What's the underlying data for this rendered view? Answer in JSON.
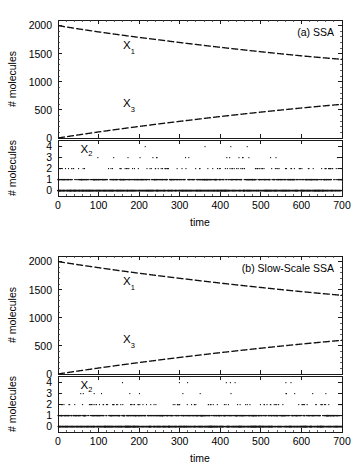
{
  "figure": {
    "panels": [
      {
        "id": "a",
        "tag": "(a) SSA",
        "top_axis": {
          "ylabel": "# molecules",
          "yticks": [
            0,
            500,
            1000,
            1500,
            2000
          ],
          "ylim": [
            0,
            2100
          ],
          "xlim": [
            0,
            700
          ]
        },
        "bottom_axis": {
          "ylabel": "# molecules",
          "yticks": [
            0,
            1,
            2,
            3,
            4
          ],
          "ylim": [
            -0.5,
            4.6
          ],
          "xlim": [
            0,
            700
          ]
        },
        "xlabel": "time",
        "xticks": [
          0,
          100,
          200,
          300,
          400,
          500,
          600,
          700
        ],
        "series_labels": [
          {
            "text": "X",
            "sub": "1",
            "x": 175,
            "y": 1580
          },
          {
            "text": "X",
            "sub": "3",
            "x": 175,
            "y": 560
          },
          {
            "text": "X",
            "sub": "2",
            "x": 70,
            "y": 3.45
          }
        ]
      },
      {
        "id": "b",
        "tag": "(b) Slow-Scale SSA",
        "top_axis": {
          "ylabel": "# molecules",
          "yticks": [
            0,
            500,
            1000,
            1500,
            2000
          ],
          "ylim": [
            0,
            2100
          ],
          "xlim": [
            0,
            700
          ]
        },
        "bottom_axis": {
          "ylabel": "# molecules",
          "yticks": [
            0,
            1,
            2,
            3,
            4
          ],
          "ylim": [
            -0.5,
            4.6
          ],
          "xlim": [
            0,
            700
          ]
        },
        "xlabel": "time",
        "xticks": [
          0,
          100,
          200,
          300,
          400,
          500,
          600,
          700
        ],
        "series_labels": [
          {
            "text": "X",
            "sub": "1",
            "x": 175,
            "y": 1580
          },
          {
            "text": "X",
            "sub": "3",
            "x": 175,
            "y": 560
          },
          {
            "text": "X",
            "sub": "2",
            "x": 70,
            "y": 3.45
          }
        ]
      }
    ]
  },
  "chart_data": [
    {
      "type": "line",
      "panel": "a",
      "title": "(a) SSA",
      "xlabel": "time",
      "ylabel": "# molecules",
      "xlim": [
        0,
        700
      ],
      "ylim": [
        0,
        2100
      ],
      "grid": false,
      "legend": "inline labels",
      "series": [
        {
          "name": "X1",
          "x": [
            0,
            50,
            100,
            150,
            200,
            250,
            300,
            350,
            400,
            450,
            500,
            550,
            600,
            650,
            700
          ],
          "values": [
            2000,
            1942,
            1888,
            1838,
            1790,
            1745,
            1700,
            1656,
            1614,
            1574,
            1535,
            1498,
            1462,
            1430,
            1400
          ]
        },
        {
          "name": "X3",
          "x": [
            0,
            50,
            100,
            150,
            200,
            250,
            300,
            350,
            400,
            450,
            500,
            550,
            600,
            650,
            700
          ],
          "values": [
            0,
            55,
            108,
            158,
            206,
            252,
            296,
            340,
            382,
            422,
            461,
            498,
            534,
            568,
            600
          ]
        }
      ]
    },
    {
      "type": "scatter",
      "panel": "a-inset",
      "title": "",
      "xlabel": "time",
      "ylabel": "# molecules",
      "xlim": [
        0,
        700
      ],
      "ylim": [
        -0.5,
        4.6
      ],
      "grid": false,
      "series": [
        {
          "name": "X2",
          "note": "integer-valued stochastic trace; level 0 near-continuous, level 1 dense, level 2 scattered, levels 3-4 rare",
          "level_density": {
            "0": 0.62,
            "1": 0.28,
            "2": 0.085,
            "3": 0.013,
            "4": 0.002
          }
        }
      ]
    },
    {
      "type": "line",
      "panel": "b",
      "title": "(b) Slow-Scale SSA",
      "xlabel": "time",
      "ylabel": "# molecules",
      "xlim": [
        0,
        700
      ],
      "ylim": [
        0,
        2100
      ],
      "grid": false,
      "legend": "inline labels",
      "series": [
        {
          "name": "X1",
          "x": [
            0,
            50,
            100,
            150,
            200,
            250,
            300,
            350,
            400,
            450,
            500,
            550,
            600,
            650,
            700
          ],
          "values": [
            2000,
            1945,
            1892,
            1841,
            1793,
            1747,
            1703,
            1660,
            1618,
            1578,
            1540,
            1502,
            1466,
            1432,
            1400
          ]
        },
        {
          "name": "X3",
          "x": [
            0,
            50,
            100,
            150,
            200,
            250,
            300,
            350,
            400,
            450,
            500,
            550,
            600,
            650,
            700
          ],
          "values": [
            0,
            54,
            106,
            156,
            204,
            250,
            295,
            338,
            380,
            420,
            459,
            497,
            533,
            567,
            600
          ]
        }
      ]
    },
    {
      "type": "scatter",
      "panel": "b-inset",
      "title": "",
      "xlabel": "time",
      "ylabel": "# molecules",
      "xlim": [
        0,
        700
      ],
      "ylim": [
        -0.5,
        4.6
      ],
      "grid": false,
      "series": [
        {
          "name": "X2",
          "note": "integer-valued stochastic trace; level 0 near-continuous, level 1 dense, level 2 scattered, levels 3-4 rare",
          "level_density": {
            "0": 0.6,
            "1": 0.3,
            "2": 0.085,
            "3": 0.012,
            "4": 0.003
          }
        }
      ]
    }
  ]
}
